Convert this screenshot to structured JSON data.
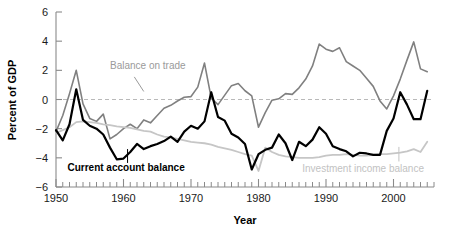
{
  "chart_data": {
    "type": "line",
    "title": "",
    "xlabel": "Year",
    "ylabel": "Percent of GDP",
    "xlim": [
      1950,
      2006
    ],
    "ylim": [
      -6,
      6
    ],
    "xticks": [
      1950,
      1960,
      1970,
      1980,
      1990,
      2000
    ],
    "xtick_labels": [
      "1950",
      "1960",
      "1970",
      "1980",
      "1990",
      "2000"
    ],
    "yticks": [
      -6,
      -4,
      -2,
      0,
      2,
      4,
      6
    ],
    "ytick_labels": [
      "−6",
      "−4",
      "−2",
      "0",
      "2",
      "4",
      "6"
    ],
    "minor_x_interval": 1,
    "grid": false,
    "zero_line": true,
    "legend_position": "inline-annotations",
    "x": [
      1950,
      1951,
      1952,
      1953,
      1954,
      1955,
      1956,
      1957,
      1958,
      1959,
      1960,
      1961,
      1962,
      1963,
      1964,
      1965,
      1966,
      1967,
      1968,
      1969,
      1970,
      1971,
      1972,
      1973,
      1974,
      1975,
      1976,
      1977,
      1978,
      1979,
      1980,
      1981,
      1982,
      1983,
      1984,
      1985,
      1986,
      1987,
      1988,
      1989,
      1990,
      1991,
      1992,
      1993,
      1994,
      1995,
      1996,
      1997,
      1998,
      1999,
      2000,
      2001,
      2002,
      2003,
      2004,
      2005
    ],
    "series": [
      {
        "name": "Balance on trade",
        "color": "#808080",
        "width": 1.6,
        "label_color": "#9a9a9a",
        "label_x": 1958,
        "label_y": 2.1,
        "leader": [
          [
            1961.6,
            1.55
          ],
          [
            1963.0,
            0.55
          ]
        ],
        "values": [
          -2.2,
          -1.1,
          0.4,
          2.0,
          -0.3,
          -1.3,
          -1.5,
          -1.0,
          -2.7,
          -2.4,
          -2.0,
          -1.7,
          -2.0,
          -1.4,
          -1.6,
          -1.1,
          -0.6,
          -0.4,
          -0.1,
          0.15,
          0.2,
          0.85,
          2.5,
          0.1,
          -0.35,
          0.3,
          0.95,
          1.1,
          0.6,
          0.25,
          -1.9,
          -0.9,
          -0.05,
          0.05,
          0.4,
          0.35,
          0.8,
          1.4,
          2.3,
          3.8,
          3.45,
          3.3,
          3.55,
          2.6,
          2.3,
          2.0,
          1.45,
          0.9,
          -0.1,
          -0.65,
          0.25,
          1.4,
          2.7,
          3.95,
          2.1,
          1.9
        ]
      },
      {
        "name": "Investment income balance",
        "color": "#c6c6c6",
        "width": 1.8,
        "label_color": "#c2c2c2",
        "label_x": 1995.5,
        "label_y": -5.0,
        "leader": [
          [
            2000.8,
            -4.25
          ],
          [
            2000.8,
            -3.25
          ]
        ],
        "values": [
          -2.3,
          -2.1,
          -1.9,
          -1.55,
          -1.5,
          -1.55,
          -1.6,
          -1.7,
          -1.75,
          -1.85,
          -1.9,
          -1.95,
          -2.05,
          -2.15,
          -2.2,
          -2.4,
          -2.55,
          -2.6,
          -2.7,
          -2.8,
          -2.9,
          -2.95,
          -3.0,
          -3.1,
          -3.25,
          -3.35,
          -3.45,
          -3.6,
          -3.75,
          -3.85,
          -4.9,
          -3.3,
          -3.6,
          -3.8,
          -3.9,
          -3.95,
          -4.0,
          -4.0,
          -4.0,
          -3.95,
          -3.85,
          -3.8,
          -3.8,
          -3.75,
          -3.8,
          -3.85,
          -3.85,
          -3.8,
          -3.75,
          -3.75,
          -3.7,
          -3.65,
          -3.55,
          -3.4,
          -3.6,
          -2.9
        ]
      },
      {
        "name": "Current account balance",
        "color": "#000000",
        "width": 2.2,
        "label_color": "#000000",
        "label_x": 1951.7,
        "label_y": -4.9,
        "leader": [
          [
            1960.6,
            -4.35
          ],
          [
            1960.6,
            -3.4
          ]
        ],
        "values": [
          -2.1,
          -2.8,
          -1.7,
          0.7,
          -1.4,
          -1.8,
          -2.0,
          -2.4,
          -3.3,
          -4.1,
          -4.05,
          -3.6,
          -3.05,
          -3.4,
          -3.2,
          -3.05,
          -2.85,
          -2.55,
          -2.9,
          -2.2,
          -1.8,
          -2.0,
          -1.5,
          0.5,
          -1.2,
          -1.45,
          -2.35,
          -2.6,
          -3.05,
          -4.8,
          -3.75,
          -3.45,
          -3.3,
          -2.4,
          -3.0,
          -4.15,
          -2.9,
          -3.2,
          -2.75,
          -1.9,
          -2.35,
          -3.2,
          -3.4,
          -3.55,
          -3.9,
          -3.65,
          -3.7,
          -3.8,
          -3.8,
          -2.15,
          -1.3,
          0.5,
          -0.35,
          -1.35,
          -1.35,
          0.6
        ]
      }
    ],
    "annotations": [
      {
        "id": "balance-on-trade-label",
        "text": "Balance on trade"
      },
      {
        "id": "investment-income-balance-label",
        "text": "Investment income balance"
      },
      {
        "id": "current-account-balance-label",
        "text": "Current account balance"
      }
    ]
  }
}
